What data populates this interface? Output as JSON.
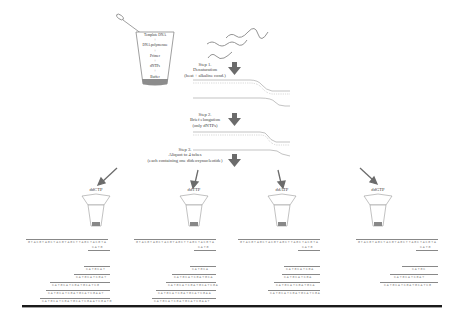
{
  "beaker": {
    "contents": [
      "Template DNA",
      "+",
      "DNA polymerase",
      "+",
      "Primer",
      "+",
      "dNTPs",
      "+",
      "Buffer"
    ]
  },
  "steps": [
    {
      "title": "Step 1.",
      "lines": [
        "Denaturation",
        "(heat + alkaline cond.)"
      ]
    },
    {
      "title": "Step 2.",
      "lines": [
        "Brief elongation",
        "(only dNTPs)"
      ]
    },
    {
      "title": "Step 3.",
      "lines": [
        "Aliquot to 4 tubes",
        "(each containing one dideoxynucleotide)"
      ]
    }
  ],
  "tubes": [
    {
      "label": "ddCTP"
    },
    {
      "label": "ddTTP"
    },
    {
      "label": "ddATP"
    },
    {
      "label": "ddGTP"
    }
  ],
  "panels": [
    {
      "template_seq": "GTACGTAGCTACGTAGCTTAGCTACGTA",
      "primer_seq": "CATG",
      "fragments": [
        "CATGCAT",
        "CATGCATCGAT",
        "CATGCATCGATGCATCG",
        "CATGCATCGATGCATCGAAT",
        "CATGCATCGATGCATCGAATCGATG"
      ]
    },
    {
      "template_seq": "GTACGTAGCTACGTAGCTTAGCTACGTA",
      "primer_seq": "CATG",
      "fragments": [
        "CATGCA",
        "CATGCATCGATGCA",
        "CATGCATCGATGCATCGA",
        "CATGCATCGATGCATCGAA",
        "CATGCATCGATGCATCGAAT"
      ]
    },
    {
      "template_seq": "GTACGTAGCTACGTAGCTTAGCTACGTA",
      "primer_seq": "CATG",
      "fragments": [
        "CATGCATCGA",
        "CATGCATCGA",
        "CATGCATCGATGCA",
        "CATGCATCGATGCATCGA"
      ]
    },
    {
      "template_seq": "GTACGTAGCTACGTAGCTTAGCTACGTA",
      "primer_seq": "CATG",
      "fragments": [
        "CATGC",
        "CATGCATCGAT",
        "CATGCATCGATGCATCG"
      ]
    }
  ],
  "strand_end_labels": {
    "five_prime": "5'",
    "three_prime": "3'"
  },
  "colors": {
    "arrow": "#6b6b6b",
    "strand": "#8a8a8a",
    "beaker_liquid": "#8c8c8c",
    "rule": "#1a1a1a"
  }
}
